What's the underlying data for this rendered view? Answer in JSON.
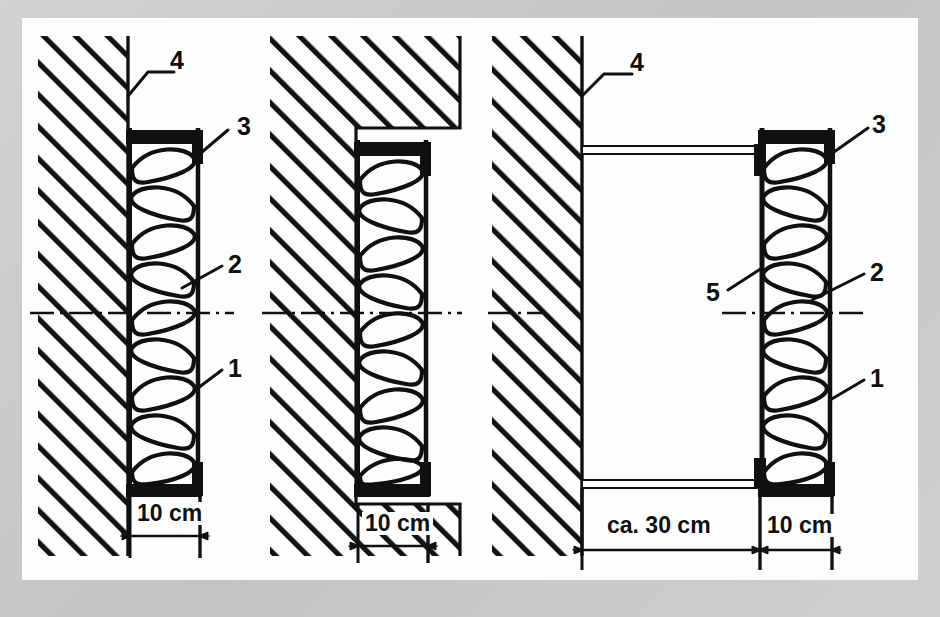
{
  "figure": {
    "background_color": "#c9c9c9",
    "canvas_color": "#fdfdfd",
    "line_color": "#101010"
  },
  "callouts": [
    {
      "id": "p1-4",
      "text": "4",
      "x": 148,
      "y": 36,
      "panel": "left",
      "refers_to": "wall-face-line"
    },
    {
      "id": "p1-3",
      "text": "3",
      "x": 222,
      "y": 102,
      "panel": "left",
      "refers_to": "radiator-top-cap"
    },
    {
      "id": "p1-2",
      "text": "2",
      "x": 222,
      "y": 250,
      "panel": "left",
      "refers_to": "convector-fins"
    },
    {
      "id": "p1-1",
      "text": "1",
      "x": 222,
      "y": 340,
      "panel": "left",
      "refers_to": "radiator-body-panel"
    },
    {
      "id": "p3-4",
      "text": "4",
      "x": 612,
      "y": 36,
      "panel": "right",
      "refers_to": "wall-face-line"
    },
    {
      "id": "p3-3",
      "text": "3",
      "x": 862,
      "y": 102,
      "panel": "right",
      "refers_to": "radiator-top-cap"
    },
    {
      "id": "p3-5",
      "text": "5",
      "x": 686,
      "y": 245,
      "panel": "right",
      "refers_to": "wall-bracket-arm"
    },
    {
      "id": "p3-2",
      "text": "2",
      "x": 862,
      "y": 258,
      "panel": "right",
      "refers_to": "convector-fins"
    },
    {
      "id": "p3-1",
      "text": "1",
      "x": 862,
      "y": 355,
      "panel": "right",
      "refers_to": "radiator-body-panel"
    }
  ],
  "dimensions": [
    {
      "id": "dim-left",
      "label": "10 cm",
      "panel": "left",
      "x": 130,
      "y": 500,
      "value": 10,
      "unit": "cm",
      "approximate": false
    },
    {
      "id": "dim-middle",
      "label": "10 cm",
      "panel": "middle",
      "x": 368,
      "y": 508,
      "value": 10,
      "unit": "cm",
      "approximate": false
    },
    {
      "id": "dim-right-gap",
      "label": "ca. 30 cm",
      "panel": "right",
      "x": 614,
      "y": 520,
      "value": 30,
      "unit": "cm",
      "approximate": true
    },
    {
      "id": "dim-right-depth",
      "label": "10 cm",
      "panel": "right",
      "x": 782,
      "y": 520,
      "value": 10,
      "unit": "cm",
      "approximate": false
    }
  ],
  "legend_keys": {
    "1": "radiator body panel",
    "2": "convector fins",
    "3": "top cap / cover rail",
    "4": "wall surface",
    "5": "wall bracket arm"
  },
  "panels": [
    {
      "name": "surface-mounted",
      "index": 1,
      "wall_type": "flat wall",
      "radiator_offset_cm": 0,
      "radiator_depth_cm": 10
    },
    {
      "name": "niche-mounted",
      "index": 2,
      "wall_type": "recessed niche",
      "radiator_offset_cm": 0,
      "radiator_depth_cm": 10
    },
    {
      "name": "bracket-mounted",
      "index": 3,
      "wall_type": "flat wall with brackets",
      "radiator_offset_cm": 30,
      "radiator_depth_cm": 10
    }
  ]
}
